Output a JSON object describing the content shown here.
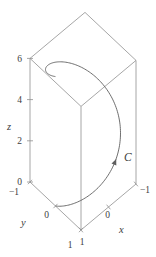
{
  "figure": {
    "background": "#ffffff"
  },
  "chart_data": {
    "type": "line",
    "subtype": "3d-parametric-curve",
    "title": "",
    "curve": {
      "label": "C",
      "x_of_t": "cos t",
      "y_of_t": "sin t",
      "z_of_t": "t",
      "t_min": 0,
      "t_max": 6.2832,
      "direction_arrow": true
    },
    "axes": {
      "x": {
        "label": "x",
        "range": [
          -1,
          1
        ],
        "ticks": [
          {
            "v": 1,
            "t": "1"
          },
          {
            "v": 0,
            "t": "0"
          },
          {
            "v": -1,
            "t": "−1"
          }
        ]
      },
      "y": {
        "label": "y",
        "range": [
          -1,
          1
        ],
        "ticks": [
          {
            "v": -1,
            "t": "−1"
          },
          {
            "v": 0,
            "t": "0"
          },
          {
            "v": 1,
            "t": "1"
          }
        ]
      },
      "z": {
        "label": "z",
        "range": [
          0,
          6
        ],
        "ticks": [
          {
            "v": 0,
            "t": "0"
          },
          {
            "v": 2,
            "t": "2"
          },
          {
            "v": 4,
            "t": "4"
          },
          {
            "v": 6,
            "t": "6"
          }
        ]
      }
    },
    "box": {
      "x": [
        -1,
        1
      ],
      "y": [
        -1,
        1
      ],
      "z": [
        0,
        6
      ]
    },
    "legend": null,
    "grid": false,
    "colors": {
      "edge": "#8f8f8f",
      "curve": "#5f5f5f",
      "text": "#3d3d3d"
    }
  }
}
